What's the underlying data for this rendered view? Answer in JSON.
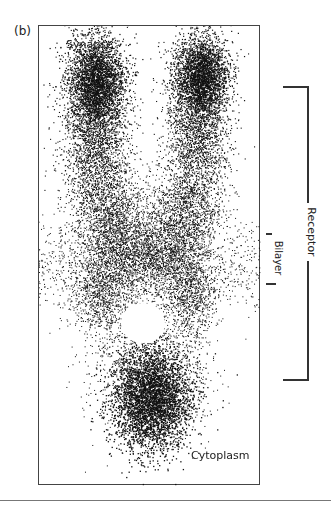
{
  "figure": {
    "panel_label": "(b)",
    "labels": {
      "top": "Synapse",
      "bottom": "Cytoplasm"
    },
    "brackets": [
      {
        "label": "Receptor",
        "y_start": 86,
        "y_end": 380
      },
      {
        "label": "Bilayer",
        "y_start": 233,
        "y_end": 284
      }
    ],
    "colors": {
      "frame": "#444444",
      "density": "#111111",
      "background": "#ffffff"
    }
  }
}
